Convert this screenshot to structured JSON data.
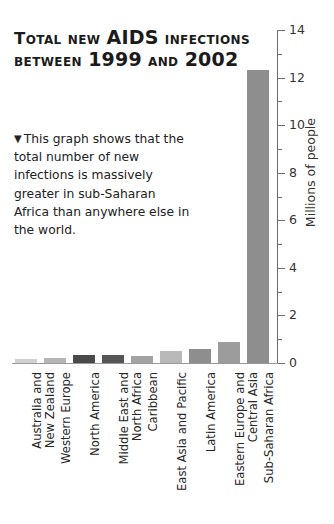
{
  "title": {
    "line1_pre": "Total new ",
    "line1_big": "AIDS",
    "line1_post": " infections",
    "line2_pre": "between ",
    "line2_big1": "1999",
    "line2_mid": " and ",
    "line2_big2": "2002"
  },
  "caption": {
    "marker": "▼",
    "text": "This graph shows that the total number of new infections is massively greater in sub-Saharan Africa than anywhere else in the world."
  },
  "chart_data": {
    "type": "bar",
    "title": "Total new AIDS infections between 1999 and 2002",
    "xlabel": "",
    "ylabel": "Millions of people",
    "ylim": [
      0,
      14
    ],
    "ytick_major": [
      0,
      2,
      4,
      6,
      8,
      10,
      12,
      14
    ],
    "ytick_minor": [
      1,
      3,
      5,
      7,
      9,
      11,
      13
    ],
    "grid": false,
    "legend": null,
    "unit": "millions of people",
    "categories": [
      "Australia and New Zealand",
      "Western Europe",
      "North America",
      "Middle East and North Africa",
      "Caribbean",
      "East Asia and Pacific",
      "Latin America",
      "Eastern Europe and Central Asia",
      "Sub-Saharan Africa"
    ],
    "category_lines": [
      [
        "Australia and",
        "New Zealand"
      ],
      [
        "Western Europe"
      ],
      [
        "North America"
      ],
      [
        "Middle East and",
        "North Africa"
      ],
      [
        "Caribbean"
      ],
      [
        "East Asia and Pacific"
      ],
      [
        "Latin America"
      ],
      [
        "Eastern Europe and",
        "Central Asia"
      ],
      [
        "Sub-Saharan Africa"
      ]
    ],
    "values": [
      0.15,
      0.2,
      0.35,
      0.35,
      0.3,
      0.5,
      0.6,
      0.9,
      12.3
    ],
    "bar_colors": [
      "#d0d0d0",
      "#b5b5b5",
      "#4a4a4a",
      "#555555",
      "#a3a3a3",
      "#b9b9b9",
      "#8e8e8e",
      "#9c9c9c",
      "#8e8e8e"
    ]
  },
  "axis": {
    "tick_labels": [
      "14",
      "12",
      "10",
      "8",
      "6",
      "4",
      "2",
      "0"
    ],
    "axis_title": "Millions of people"
  }
}
